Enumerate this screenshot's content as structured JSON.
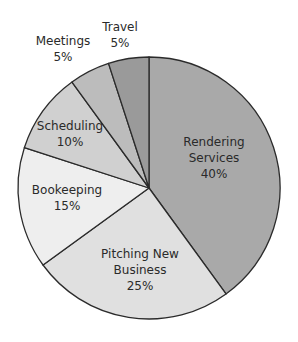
{
  "chart_data": {
    "type": "pie",
    "title": "",
    "start_angle_deg": 0,
    "direction": "clockwise",
    "slices": [
      {
        "label": "Rendering Services",
        "value": 40,
        "pct_label": "40%",
        "color": "#a9a9a9"
      },
      {
        "label": "Pitching New Business",
        "value": 25,
        "pct_label": "25%",
        "color": "#e0e0e0"
      },
      {
        "label": "Bookeeping",
        "value": 15,
        "pct_label": "15%",
        "color": "#eeeeee"
      },
      {
        "label": "Scheduling",
        "value": 10,
        "pct_label": "10%",
        "color": "#d0d0d0"
      },
      {
        "label": "Meetings",
        "value": 5,
        "pct_label": "5%",
        "color": "#bcbcbc"
      },
      {
        "label": "Travel",
        "value": 5,
        "pct_label": "5%",
        "color": "#9a9a9a"
      }
    ],
    "categories": [
      "Rendering Services",
      "Pitching New Business",
      "Bookeeping",
      "Scheduling",
      "Meetings",
      "Travel"
    ],
    "values": [
      40,
      25,
      15,
      10,
      5,
      5
    ],
    "legend": "none (labels on slices)"
  },
  "labels": {
    "rendering": {
      "line1": "Rendering",
      "line2": "Services",
      "pct": "40%"
    },
    "pitching": {
      "line1": "Pitching New",
      "line2": "Business",
      "pct": "25%"
    },
    "bookeeping": {
      "line1": "Bookeeping",
      "pct": "15%"
    },
    "scheduling": {
      "line1": "Scheduling",
      "pct": "10%"
    },
    "meetings": {
      "line1": "Meetings",
      "pct": "5%"
    },
    "travel": {
      "line1": "Travel",
      "pct": "5%"
    }
  }
}
